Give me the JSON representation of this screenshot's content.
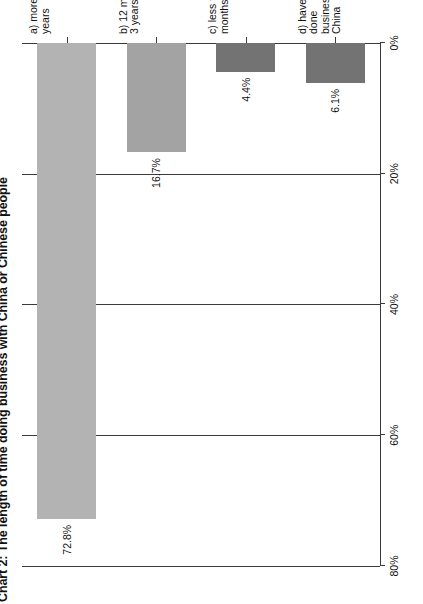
{
  "title": "Chart 2: The length of time doing business with China or Chinese people",
  "colors": {
    "bar_a": "#b3b3b3",
    "bar_b": "#a3a3a3",
    "bar_c": "#737373",
    "bar_d": "#737373",
    "axis": "#3a3a3a",
    "text": "#111111",
    "background": "#ffffff"
  },
  "chart_data": {
    "type": "bar",
    "orientation": "horizontal",
    "title": "Chart 2: The length of time doing business with China or Chinese people",
    "xlabel": "",
    "ylabel": "",
    "categories": [
      "a) more than 3 years",
      "b) 12 months to 3 years",
      "c) less than 12 months",
      "d) have never done\nbusiness with China"
    ],
    "values": [
      72.8,
      16.7,
      4.4,
      6.1
    ],
    "value_labels": [
      "72.8%",
      "16.7%",
      "4.4%",
      "6.1%"
    ],
    "bar_colors": [
      "#b3b3b3",
      "#a3a3a3",
      "#737373",
      "#737373"
    ],
    "axis_ticks": [
      "0%",
      "20%",
      "40%",
      "60%",
      "80%"
    ],
    "axis_tick_values": [
      0,
      20,
      40,
      60,
      80
    ],
    "xlim": [
      0,
      80
    ],
    "grid": true,
    "legend": "none"
  }
}
